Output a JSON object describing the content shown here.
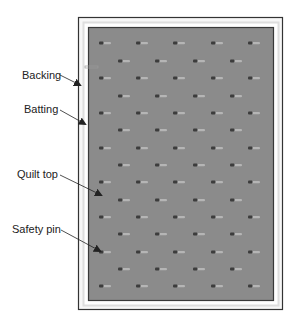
{
  "diagram": {
    "type": "quilt-layers-pin-basting",
    "colors": {
      "background": "#ffffff",
      "backing_border": "#333333",
      "backing_fill": "#f7f7f7",
      "batting_band": "#dedede",
      "quilt_top_fill": "#8b8b8b",
      "quilt_top_border": "#3a3a3a",
      "pin_head": "#3c3c3c",
      "pin_tail": "#b5b5b5",
      "arrow": "#222222",
      "label_text": "#222222"
    },
    "labels": [
      {
        "id": "backing",
        "text": "Backing",
        "x": 22,
        "y": 69,
        "arrow": {
          "x1": 60,
          "y1": 75,
          "x2": 80,
          "y2": 85
        }
      },
      {
        "id": "batting",
        "text": "Batting",
        "x": 24,
        "y": 103,
        "arrow": {
          "x1": 60,
          "y1": 110,
          "x2": 85,
          "y2": 124
        }
      },
      {
        "id": "quilt-top",
        "text": "Quilt top",
        "x": 17,
        "y": 168,
        "arrow": {
          "x1": 60,
          "y1": 175,
          "x2": 101,
          "y2": 195
        }
      },
      {
        "id": "safety-pin",
        "text": "Safety pin",
        "x": 12,
        "y": 223,
        "arrow": {
          "x1": 61,
          "y1": 230,
          "x2": 100,
          "y2": 251
        }
      }
    ],
    "layers": {
      "backing": {
        "x": 78,
        "y": 17,
        "w": 204,
        "h": 292
      },
      "batting": {
        "x": 83,
        "y": 22,
        "w": 195,
        "h": 283
      },
      "quilt_top": {
        "x": 88,
        "y": 27,
        "w": 185,
        "h": 273
      }
    },
    "pins": {
      "odd_row_x": [
        102,
        139,
        176,
        214,
        251
      ],
      "even_row_x": [
        121,
        158,
        196,
        233
      ],
      "row_y": [
        43,
        61,
        78,
        96,
        113,
        130,
        148,
        165,
        182,
        200,
        217,
        234,
        252,
        269,
        286
      ],
      "extra": [
        {
          "x": 85,
          "y": 67
        }
      ]
    }
  }
}
